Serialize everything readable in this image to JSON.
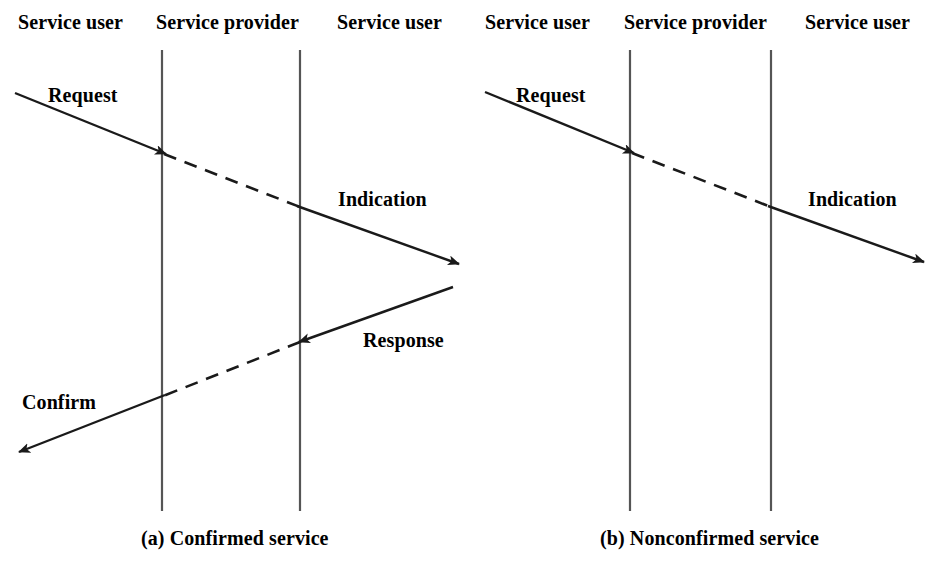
{
  "figure": {
    "panels": [
      {
        "id": "a",
        "caption": "(a) Confirmed service",
        "columns": [
          {
            "label": "Service user"
          },
          {
            "label": "Service provider"
          },
          {
            "label": "Service user"
          }
        ],
        "messages": [
          {
            "label": "Request",
            "style": "solid-then-dashed",
            "direction": "left-to-right"
          },
          {
            "label": "Indication",
            "style": "dashed-then-solid",
            "direction": "left-to-right"
          },
          {
            "label": "Response",
            "style": "solid-then-dashed",
            "direction": "right-to-left"
          },
          {
            "label": "Confirm",
            "style": "dashed-then-solid",
            "direction": "right-to-left"
          }
        ]
      },
      {
        "id": "b",
        "caption": "(b) Nonconfirmed service",
        "columns": [
          {
            "label": "Service user"
          },
          {
            "label": "Service provider"
          },
          {
            "label": "Service user"
          }
        ],
        "messages": [
          {
            "label": "Request",
            "style": "solid-then-dashed",
            "direction": "left-to-right"
          },
          {
            "label": "Indication",
            "style": "dashed-then-solid",
            "direction": "left-to-right"
          }
        ]
      }
    ]
  },
  "panel_a": {
    "header_left": "Service user",
    "header_mid": "Service provider",
    "header_right": "Service user",
    "msg_request": "Request",
    "msg_indication": "Indication",
    "msg_response": "Response",
    "msg_confirm": "Confirm",
    "caption": "(a) Confirmed service"
  },
  "panel_b": {
    "header_left": "Service user",
    "header_mid": "Service provider",
    "header_right": "Service user",
    "msg_request": "Request",
    "msg_indication": "Indication",
    "caption": "(b) Nonconfirmed service"
  },
  "colors": {
    "line": "#1a1a1a",
    "text": "#000000",
    "background": "#ffffff"
  }
}
